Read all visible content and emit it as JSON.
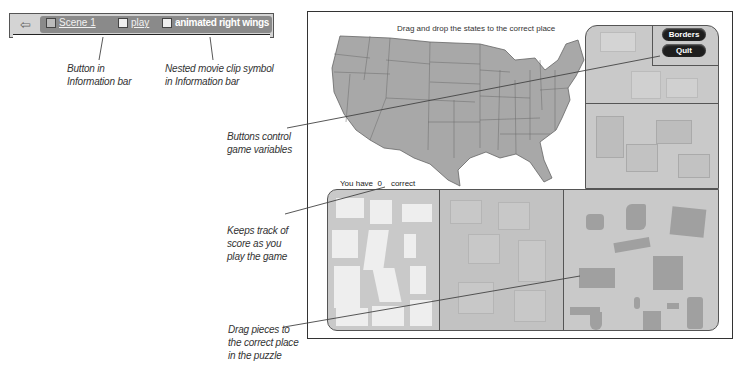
{
  "info_bar": {
    "back_icon": "back-arrow-icon",
    "breadcrumbs": [
      {
        "icon": "clapperboard-icon",
        "label": "Scene 1"
      },
      {
        "icon": "button-symbol-icon",
        "label": "play"
      },
      {
        "icon": "movie-clip-icon",
        "label": "animated right wings"
      }
    ]
  },
  "callouts": {
    "button_info_bar": [
      "Button in",
      "Information bar"
    ],
    "nested_clip": [
      "Nested movie clip symbol",
      "in Information bar"
    ],
    "buttons_control": [
      "Buttons control",
      "game variables"
    ],
    "keeps_track": [
      "Keeps track of",
      "score as you",
      "play the game"
    ],
    "drag_pieces": [
      "Drag pieces to",
      "the correct place",
      "in the puzzle"
    ]
  },
  "game": {
    "title": "Drag and drop the states to the correct place",
    "score_prefix": "You have",
    "score_value": "0",
    "score_suffix": "correct",
    "buttons": {
      "borders": "Borders",
      "quit": "Quit"
    }
  },
  "colors": {
    "map_fill": "#a8a8a8",
    "panel_fill": "#c9c9c9",
    "button_bg": "#1e1e1e",
    "piece_light": "#eeeeee",
    "piece_dark": "#a0a0a0"
  }
}
